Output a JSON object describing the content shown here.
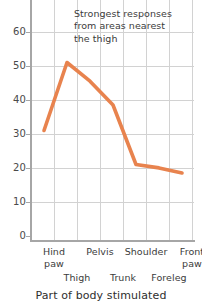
{
  "chart_data": {
    "type": "line",
    "title": "",
    "xlabel": "Part of body stimulated",
    "ylabel": "",
    "categories": [
      "Hind paw",
      "Thigh",
      "Pelvis",
      "Trunk",
      "Shoulder",
      "Foreleg",
      "Front paw"
    ],
    "values": [
      32.5,
      52.5,
      47,
      40,
      22.5,
      21.5,
      20
    ],
    "ylim": [
      0,
      65
    ],
    "yticks": [
      0,
      10,
      20,
      30,
      40,
      50,
      60
    ],
    "ytick_labels": [
      "0",
      "10",
      "20",
      "30",
      "40",
      "50",
      "60"
    ],
    "grid": true,
    "legend": "none",
    "series_color": "#e8834e",
    "grid_color": "#d2d2d2",
    "axis_color": "#a6a6a6",
    "annotations": [
      {
        "lines": [
          "Strongest responses",
          "from areas nearest",
          "the thigh"
        ]
      }
    ]
  },
  "axis": {
    "x_title": "Part of body stimulated",
    "x_labels_top": [
      {
        "lines": [
          "Hind",
          "paw"
        ]
      },
      {
        "lines": [
          "Pelvis"
        ]
      },
      {
        "lines": [
          "Shoulder"
        ]
      },
      {
        "lines": [
          "Front",
          "paw"
        ]
      }
    ],
    "x_labels_bottom": [
      {
        "lines": [
          "Thigh"
        ]
      },
      {
        "lines": [
          "Trunk"
        ]
      },
      {
        "lines": [
          "Foreleg"
        ]
      }
    ],
    "y_labels": [
      "60",
      "50",
      "40",
      "30",
      "20",
      "10",
      "0"
    ]
  },
  "annotation": {
    "line1": "Strongest responses",
    "line2": "from areas nearest",
    "line3": "the thigh"
  }
}
